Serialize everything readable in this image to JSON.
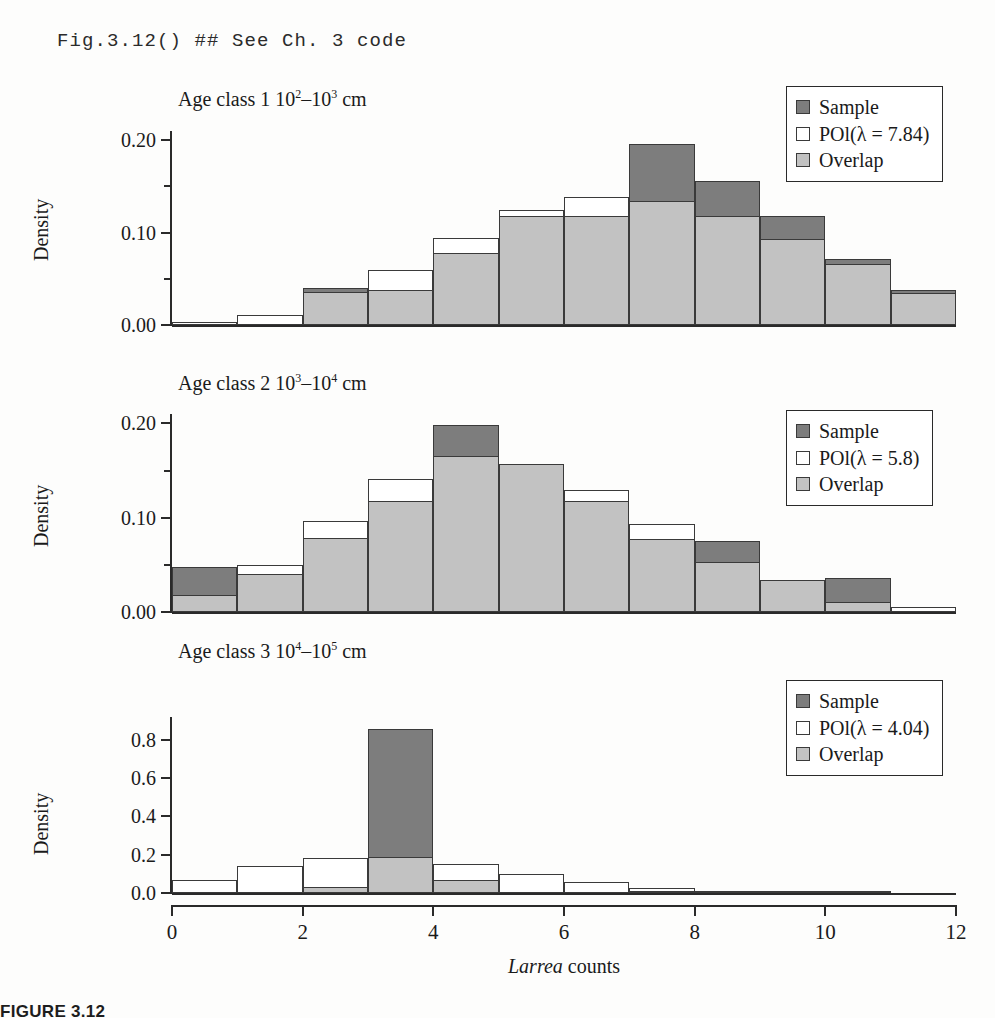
{
  "code_line": "Fig.3.12() ## See Ch. 3 code",
  "figure_caption": "FIGURE 3.12",
  "colors": {
    "sample": "#7d7d7d",
    "poisson": "#ffffff",
    "overlap": "#c2c2c2",
    "axis": "#2a2a2a",
    "outline": "#3a3a3a"
  },
  "legend_labels": {
    "sample": "Sample",
    "overlap": "Overlap"
  },
  "xaxis": {
    "title_italic": "Larrea",
    "title_rest": " counts",
    "ticks": [
      0,
      2,
      4,
      6,
      8,
      10,
      12
    ],
    "min": 0,
    "max": 12
  },
  "chart_data": [
    {
      "type": "bar",
      "title_prefix": "Age class 1  10",
      "title_sup1": "2",
      "title_mid": "–10",
      "title_sup2": "3",
      "title_suffix": " cm",
      "title": "Age class 1  10^2–10^3 cm",
      "legend_poisson": "POl(λ = 7.84)",
      "lambda": 7.84,
      "ylabel": "Density",
      "ylim": [
        0,
        0.21
      ],
      "yticks": [
        0.0,
        0.1,
        0.2
      ],
      "ytick_labels": [
        "0.00",
        "0.10",
        "0.20"
      ],
      "yminor": [
        0.05,
        0.15
      ],
      "grid": false,
      "legend_position": "top-right",
      "xlabel": "",
      "bin_edges": [
        0,
        1,
        2,
        3,
        4,
        5,
        6,
        7,
        8,
        9,
        10,
        11,
        12
      ],
      "series": [
        {
          "name": "Sample",
          "values": [
            0.0,
            0.0,
            0.04,
            0.038,
            0.078,
            0.118,
            0.118,
            0.196,
            0.156,
            0.118,
            0.072,
            0.038
          ]
        },
        {
          "name": "POl",
          "values": [
            0.003,
            0.011,
            0.036,
            0.06,
            0.094,
            0.125,
            0.139,
            0.134,
            0.118,
            0.093,
            0.066,
            0.035
          ]
        },
        {
          "name": "Overlap",
          "values": [
            0.0,
            0.0,
            0.036,
            0.038,
            0.078,
            0.118,
            0.118,
            0.134,
            0.118,
            0.093,
            0.066,
            0.035
          ]
        }
      ]
    },
    {
      "type": "bar",
      "title_prefix": "Age class 2  10",
      "title_sup1": "3",
      "title_mid": "–10",
      "title_sup2": "4",
      "title_suffix": " cm",
      "title": "Age class 2  10^3–10^4 cm",
      "legend_poisson": "POl(λ = 5.8)",
      "lambda": 5.8,
      "ylabel": "Density",
      "ylim": [
        0,
        0.21
      ],
      "yticks": [
        0.0,
        0.1,
        0.2
      ],
      "ytick_labels": [
        "0.00",
        "0.10",
        "0.20"
      ],
      "yminor": [
        0.05,
        0.15
      ],
      "grid": false,
      "legend_position": "top-right",
      "xlabel": "",
      "bin_edges": [
        0,
        1,
        2,
        3,
        4,
        5,
        6,
        7,
        8,
        9,
        10,
        11,
        12
      ],
      "series": [
        {
          "name": "Sample",
          "values": [
            0.048,
            0.04,
            0.078,
            0.118,
            0.198,
            0.157,
            0.118,
            0.077,
            0.075,
            0.034,
            0.036,
            0.0
          ]
        },
        {
          "name": "POl",
          "values": [
            0.018,
            0.05,
            0.097,
            0.141,
            0.165,
            0.157,
            0.129,
            0.093,
            0.053,
            0.034,
            0.011,
            0.005
          ]
        },
        {
          "name": "Overlap",
          "values": [
            0.018,
            0.04,
            0.078,
            0.118,
            0.165,
            0.157,
            0.118,
            0.077,
            0.053,
            0.034,
            0.011,
            0.0
          ]
        }
      ]
    },
    {
      "type": "bar",
      "title_prefix": "Age class 3  10",
      "title_sup1": "4",
      "title_mid": "–10",
      "title_sup2": "5",
      "title_suffix": " cm",
      "title": "Age class 3  10^4–10^5 cm",
      "legend_poisson": "POl(λ = 4.04)",
      "lambda": 4.04,
      "ylabel": "Density",
      "ylim": [
        0,
        0.92
      ],
      "yticks": [
        0.0,
        0.2,
        0.4,
        0.6,
        0.8
      ],
      "ytick_labels": [
        "0.0",
        "0.2",
        "0.4",
        "0.6",
        "0.8"
      ],
      "yminor": [],
      "grid": false,
      "legend_position": "top-right",
      "xlabel": "Larrea counts",
      "bin_edges": [
        0,
        1,
        2,
        3,
        4,
        5,
        6,
        7,
        8,
        9,
        10,
        11,
        12
      ],
      "series": [
        {
          "name": "Sample",
          "values": [
            0.0,
            0.0,
            0.032,
            0.855,
            0.07,
            0.0,
            0.0,
            0.005,
            0.003,
            0.0,
            0.0,
            0.0
          ]
        },
        {
          "name": "POl",
          "values": [
            0.068,
            0.14,
            0.185,
            0.19,
            0.15,
            0.098,
            0.055,
            0.024,
            0.01,
            0.003,
            0.001,
            0.0
          ]
        },
        {
          "name": "Overlap",
          "values": [
            0.0,
            0.0,
            0.032,
            0.19,
            0.07,
            0.0,
            0.0,
            0.005,
            0.003,
            0.0,
            0.0,
            0.0
          ]
        }
      ]
    }
  ]
}
